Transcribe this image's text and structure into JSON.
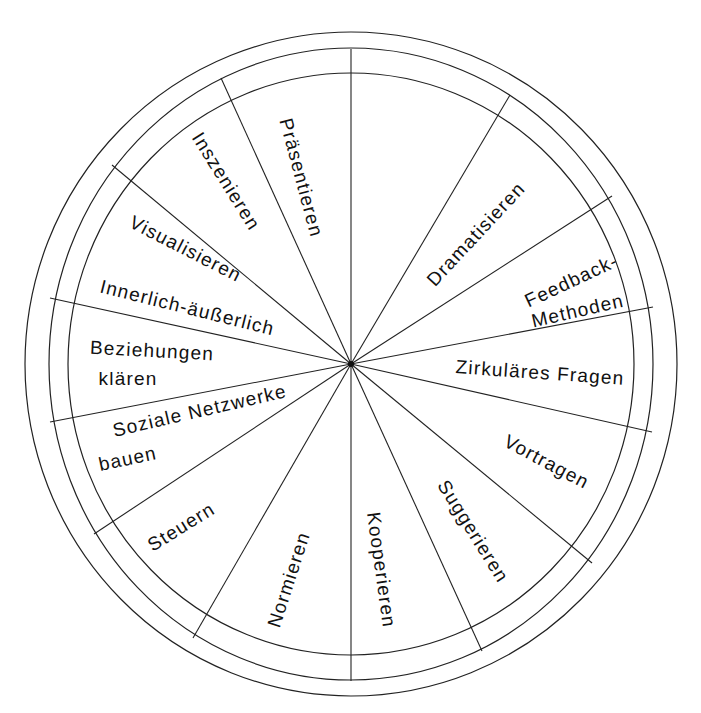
{
  "diagram": {
    "type": "segmented-wheel",
    "center": [
      351,
      364
    ],
    "rings": [
      {
        "name": "outer-ring",
        "rx": 326,
        "ry": 332
      },
      {
        "name": "middle-ring",
        "rx": 302,
        "ry": 316
      },
      {
        "name": "inner-ring",
        "rx": 283,
        "ry": 291
      }
    ],
    "spoke_endpoints": [
      [
        351,
        49
      ],
      [
        510,
        95
      ],
      [
        612,
        196
      ],
      [
        653,
        307
      ],
      [
        652,
        432
      ],
      [
        592,
        563
      ],
      [
        482,
        651
      ],
      [
        351,
        681
      ],
      [
        193,
        638
      ],
      [
        94,
        534
      ],
      [
        50,
        422
      ],
      [
        50,
        298
      ],
      [
        112,
        165
      ],
      [
        221,
        78
      ]
    ],
    "segments": [
      {
        "label": "Präsentieren",
        "x": 300,
        "y": 178,
        "rotate": 75
      },
      {
        "label": "Inszenieren",
        "x": 225,
        "y": 182,
        "rotate": 58
      },
      {
        "label": "Visualisieren",
        "x": 185,
        "y": 250,
        "rotate": 27
      },
      {
        "label": "Innerlich-äußerlich",
        "x": 187,
        "y": 309,
        "rotate": 14
      },
      {
        "label": "Beziehungen",
        "x": 152,
        "y": 352,
        "rotate": 3
      },
      {
        "label": "klären",
        "x": 128,
        "y": 380,
        "rotate": 0
      },
      {
        "label": "Soziale Netzwerke",
        "x": 200,
        "y": 412,
        "rotate": -13
      },
      {
        "label": "bauen",
        "x": 128,
        "y": 460,
        "rotate": -12
      },
      {
        "label": "Steuern",
        "x": 182,
        "y": 528,
        "rotate": -32
      },
      {
        "label": "Normieren",
        "x": 290,
        "y": 580,
        "rotate": -72
      },
      {
        "label": "Kooperieren",
        "x": 380,
        "y": 570,
        "rotate": 82
      },
      {
        "label": "Suggerieren",
        "x": 472,
        "y": 532,
        "rotate": 58
      },
      {
        "label": "Vortragen",
        "x": 546,
        "y": 463,
        "rotate": 28
      },
      {
        "label": "Zirkuläres Fragen",
        "x": 540,
        "y": 374,
        "rotate": 4
      },
      {
        "label": "Feedback-",
        "x": 572,
        "y": 282,
        "rotate": -25
      },
      {
        "label": "Methoden",
        "x": 578,
        "y": 312,
        "rotate": -13
      },
      {
        "label": "Dramatisieren",
        "x": 477,
        "y": 235,
        "rotate": -47
      }
    ]
  }
}
